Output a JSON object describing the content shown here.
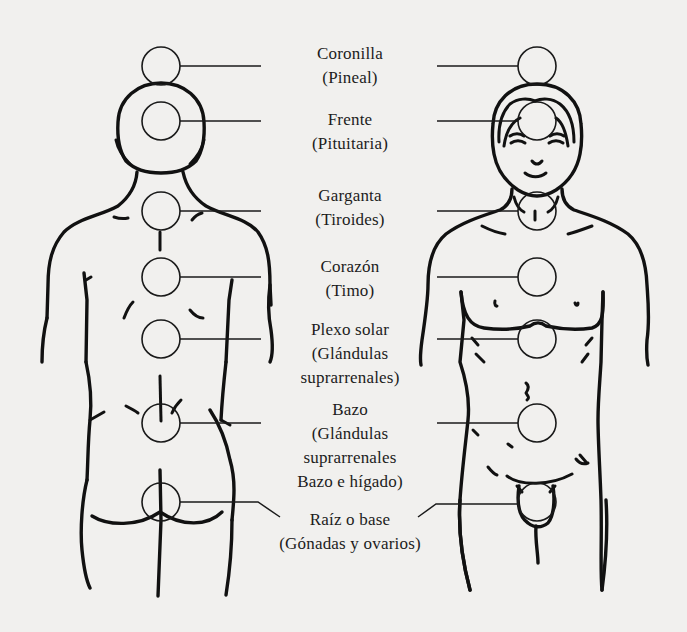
{
  "diagram": {
    "title": "",
    "views": [
      "back-view",
      "front-view"
    ],
    "colors": {
      "ink": "#111111",
      "paper": "#f1f0ee"
    },
    "chakras": [
      {
        "id": "coronilla",
        "name": "Coronilla",
        "gland": "(Pineal)",
        "lines": [
          "Coronilla",
          "(Pineal)"
        ]
      },
      {
        "id": "frente",
        "name": "Frente",
        "gland": "(Pituitaria)",
        "lines": [
          "Frente",
          "(Pituitaria)"
        ]
      },
      {
        "id": "garganta",
        "name": "Garganta",
        "gland": "(Tiroides)",
        "lines": [
          "Garganta",
          "(Tiroides)"
        ]
      },
      {
        "id": "corazon",
        "name": "Corazón",
        "gland": "(Timo)",
        "lines": [
          "Corazón",
          "(Timo)"
        ]
      },
      {
        "id": "plexo-solar",
        "name": "Plexo solar",
        "gland": "(Glándulas suprarrenales)",
        "lines": [
          "Plexo solar",
          "(Glándulas",
          "suprarrenales)"
        ]
      },
      {
        "id": "bazo",
        "name": "Bazo",
        "gland": "(Glándulas suprarrenales Bazo e hígado)",
        "lines": [
          "Bazo",
          "(Glándulas",
          "suprarrenales",
          "Bazo e hígado)"
        ]
      },
      {
        "id": "raiz",
        "name": "Raíz o base",
        "gland": "(Gónadas y ovarios)",
        "lines": [
          "Raíz o base",
          "(Gónadas y ovarios)"
        ]
      }
    ]
  }
}
